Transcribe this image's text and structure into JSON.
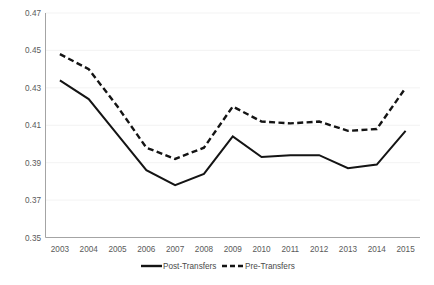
{
  "chart_data": {
    "type": "line",
    "title": "",
    "xlabel": "",
    "ylabel": "",
    "categories": [
      "2003",
      "2004",
      "2005",
      "2006",
      "2007",
      "2008",
      "2009",
      "2010",
      "2011",
      "2012",
      "2013",
      "2014",
      "2015"
    ],
    "x": [
      2003,
      2004,
      2005,
      2006,
      2007,
      2008,
      2009,
      2010,
      2011,
      2012,
      2013,
      2014,
      2015
    ],
    "series": [
      {
        "name": "Post-Transfers",
        "style": "solid",
        "color": "#141414",
        "values": [
          0.434,
          0.424,
          0.405,
          0.386,
          0.378,
          0.384,
          0.404,
          0.393,
          0.394,
          0.394,
          0.387,
          0.389,
          0.407
        ]
      },
      {
        "name": "Pre-Transfers",
        "style": "dashed",
        "color": "#141414",
        "values": [
          0.448,
          0.44,
          0.42,
          0.398,
          0.392,
          0.398,
          0.42,
          0.412,
          0.411,
          0.412,
          0.407,
          0.408,
          0.43
        ]
      }
    ],
    "ylim": [
      0.35,
      0.47
    ],
    "yticks": [
      0.35,
      0.37,
      0.39,
      0.41,
      0.43,
      0.45,
      0.47
    ],
    "ytick_labels": [
      "0.35",
      "0.37",
      "0.39",
      "0.41",
      "0.43",
      "0.45",
      "0.47"
    ],
    "xtick_labels": [
      "2003",
      "2004",
      "2005",
      "2006",
      "2007",
      "2008",
      "2009",
      "2010",
      "2011",
      "2012",
      "2013",
      "2014",
      "2015"
    ],
    "grid": true,
    "grid_axis": "y",
    "legend_position": "bottom",
    "legend_entries": [
      {
        "label": "Post-Transfers",
        "style": "solid"
      },
      {
        "label": "Pre-Transfers",
        "style": "dashed"
      }
    ],
    "colors": {
      "background": "#ffffff",
      "gridline": "#f0f0f0",
      "axis": "#9a9a9a",
      "tick_text": "#5a5a5a",
      "series": "#141414"
    }
  }
}
